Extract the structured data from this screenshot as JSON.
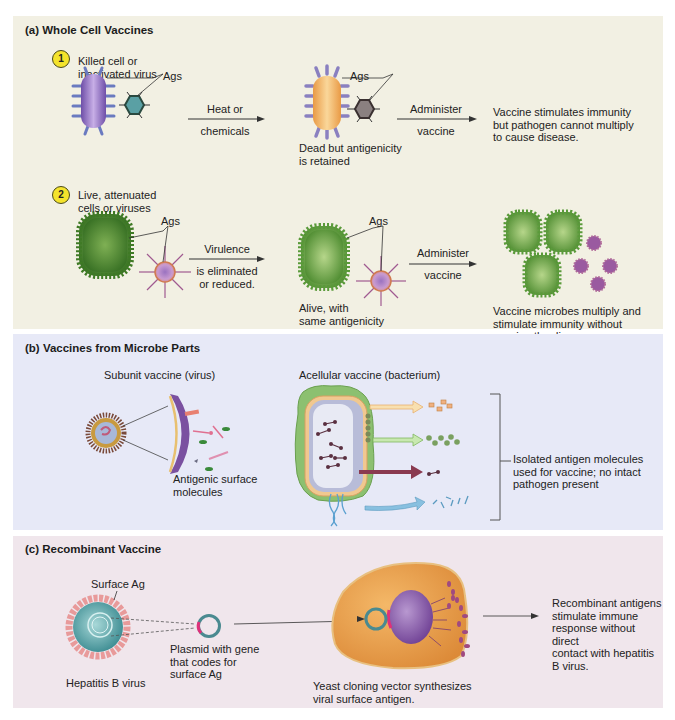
{
  "panel_a": {
    "title": "(a) Whole Cell Vaccines",
    "background": "#f2f0e3",
    "step1": {
      "badge": "1",
      "label": "Killed cell or\ninactivated virus",
      "ags_label": "Ags",
      "arrow1": {
        "top": "Heat or",
        "bottom": "chemicals"
      },
      "middle_ags_label": "Ags",
      "middle_caption": "Dead but antigenicity\nis retained",
      "arrow2": {
        "top": "Administer",
        "bottom": "vaccine"
      },
      "result": "Vaccine stimulates immunity\nbut pathogen cannot multiply\nto cause disease."
    },
    "step2": {
      "badge": "2",
      "label": "Live, attenuated\ncells or viruses",
      "ags_label": "Ags",
      "arrow1": {
        "top": "Virulence",
        "bottom": "is eliminated\nor reduced."
      },
      "middle_ags_label": "Ags",
      "middle_caption": "Alive, with\nsame antigenicity",
      "arrow2": {
        "top": "Administer",
        "bottom": "vaccine"
      },
      "result": "Vaccine microbes multiply and\nstimulate immunity without\ncausing the disease."
    }
  },
  "panel_b": {
    "title": "(b) Vaccines from Microbe Parts",
    "background": "#e7e9f7",
    "subunit_label": "Subunit vaccine (virus)",
    "subunit_caption": "Antigenic surface\nmolecules",
    "acellular_label": "Acellular vaccine (bacterium)",
    "bracket_caption": "Isolated antigen molecules\nused for vaccine; no intact\npathogen present"
  },
  "panel_c": {
    "title": "(c) Recombinant Vaccine",
    "background": "#f0e6ec",
    "surface_ag_label": "Surface Ag",
    "virus_label": "Hepatitis B virus",
    "plasmid_label": "Plasmid with gene\nthat codes for\nsurface Ag",
    "yeast_caption": "Yeast cloning vector synthesizes\nviral surface antigen.",
    "result": "Recombinant antigens\nstimulate immune\nresponse without direct\ncontact with hepatitis\nB virus."
  },
  "colors": {
    "badge_yellow": "#f4e32c",
    "killed_cell_purple": "#9a7ac8",
    "dead_cell_orange": "#f0b060",
    "live_cell_green": "#5a9a3a",
    "virus_pink": "#b06a98",
    "yeast_orange": "#e8a050",
    "nucleus_purple": "#8a5aa8"
  }
}
